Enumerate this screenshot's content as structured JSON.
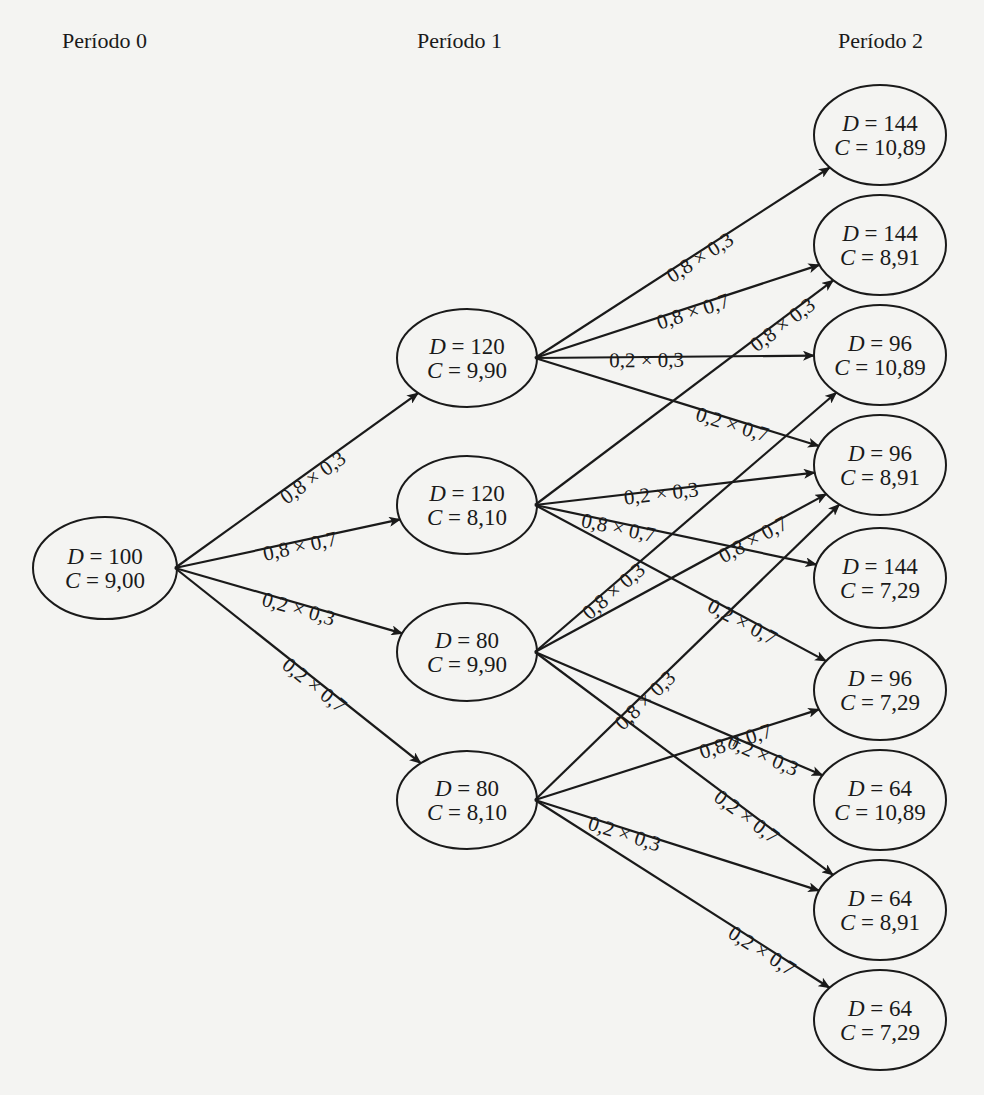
{
  "periods": [
    {
      "label": "Período 0"
    },
    {
      "label": "Período 1"
    },
    {
      "label": "Período 2"
    }
  ],
  "nodes": [
    {
      "id": "n0",
      "period": 0,
      "D": "100",
      "C": "9,00"
    },
    {
      "id": "n1a",
      "period": 1,
      "D": "120",
      "C": "9,90"
    },
    {
      "id": "n1b",
      "period": 1,
      "D": "120",
      "C": "8,10"
    },
    {
      "id": "n1c",
      "period": 1,
      "D": "80",
      "C": "9,90"
    },
    {
      "id": "n1d",
      "period": 1,
      "D": "80",
      "C": "8,10"
    },
    {
      "id": "n2a",
      "period": 2,
      "D": "144",
      "C": "10,89"
    },
    {
      "id": "n2b",
      "period": 2,
      "D": "144",
      "C": "8,91"
    },
    {
      "id": "n2c",
      "period": 2,
      "D": "96",
      "C": "10,89"
    },
    {
      "id": "n2d",
      "period": 2,
      "D": "96",
      "C": "8,91"
    },
    {
      "id": "n2e",
      "period": 2,
      "D": "144",
      "C": "7,29"
    },
    {
      "id": "n2f",
      "period": 2,
      "D": "96",
      "C": "7,29"
    },
    {
      "id": "n2g",
      "period": 2,
      "D": "64",
      "C": "10,89"
    },
    {
      "id": "n2h",
      "period": 2,
      "D": "64",
      "C": "8,91"
    },
    {
      "id": "n2i",
      "period": 2,
      "D": "64",
      "C": "7,29"
    }
  ],
  "edges": [
    {
      "from": "n0",
      "to": "n1a",
      "label": "0,8 × 0,3"
    },
    {
      "from": "n0",
      "to": "n1b",
      "label": "0,8 × 0,7"
    },
    {
      "from": "n0",
      "to": "n1c",
      "label": "0,2 × 0,3"
    },
    {
      "from": "n0",
      "to": "n1d",
      "label": "0,2 × 0,7"
    },
    {
      "from": "n1a",
      "to": "n2a",
      "label": "0,8 × 0,3"
    },
    {
      "from": "n1a",
      "to": "n2b",
      "label": "0,8 × 0,7"
    },
    {
      "from": "n1a",
      "to": "n2c",
      "label": "0,2 × 0,3"
    },
    {
      "from": "n1a",
      "to": "n2d",
      "label": "0,2 × 0,7"
    },
    {
      "from": "n1b",
      "to": "n2b",
      "label": "0,8 × 0,3"
    },
    {
      "from": "n1b",
      "to": "n2d",
      "label": "0,2 × 0,3"
    },
    {
      "from": "n1b",
      "to": "n2e",
      "label": "0,8 × 0,7"
    },
    {
      "from": "n1b",
      "to": "n2f",
      "label": "0,2 × 0,7"
    },
    {
      "from": "n1c",
      "to": "n2c",
      "label": "0,8 × 0,3"
    },
    {
      "from": "n1c",
      "to": "n2d",
      "label": "0,8 × 0,7"
    },
    {
      "from": "n1c",
      "to": "n2g",
      "label": "0,2 × 0,3"
    },
    {
      "from": "n1c",
      "to": "n2h",
      "label": "0,2 × 0,7"
    },
    {
      "from": "n1d",
      "to": "n2d",
      "label": "0,8 × 0,3"
    },
    {
      "from": "n1d",
      "to": "n2f",
      "label": "0,8 × 0,7"
    },
    {
      "from": "n1d",
      "to": "n2h",
      "label": "0,2 × 0,3"
    },
    {
      "from": "n1d",
      "to": "n2i",
      "label": "0,2 × 0,7"
    }
  ],
  "symbols": {
    "demand": "D",
    "cost": "C",
    "equals": " = "
  }
}
